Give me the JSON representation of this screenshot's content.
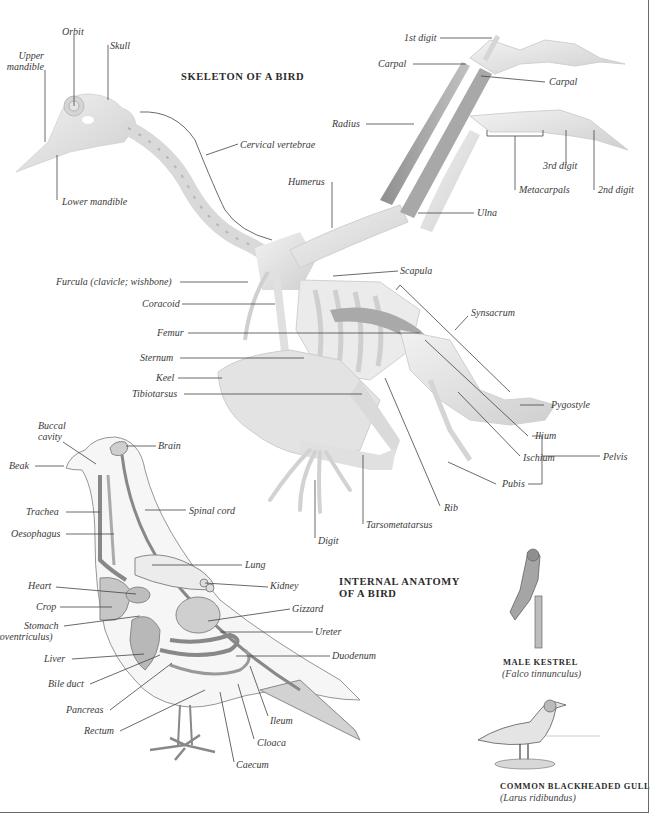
{
  "skeleton": {
    "title": "SKELETON OF A BIRD",
    "labels": {
      "orbit": "Orbit",
      "skull": "Skull",
      "upper_mandible_1": "Upper",
      "upper_mandible_2": "mandible",
      "lower_mandible": "Lower mandible",
      "cervical_vertebrae": "Cervical vertebrae",
      "first_digit": "1st digit",
      "carpal_left": "Carpal",
      "carpal_right": "Carpal",
      "radius": "Radius",
      "third_digit": "3rd digit",
      "metacarpals": "Metacarpals",
      "second_digit": "2nd digit",
      "humerus": "Humerus",
      "ulna": "Ulna",
      "furcula": "Furcula (clavicle; wishbone)",
      "scapula": "Scapula",
      "coracoid": "Coracoid",
      "synsacrum": "Synsacrum",
      "femur": "Femur",
      "sternum": "Sternum",
      "keel": "Keel",
      "tibiotarsus": "Tibiotarsus",
      "pygostyle": "Pygostyle",
      "ilium": "Ilium",
      "ischium": "Ischium",
      "pelvis": "Pelvis",
      "pubis": "Pubis",
      "rib": "Rib",
      "tarsometatarsus": "Tarsometatarsus",
      "digit": "Digit"
    }
  },
  "internal": {
    "title_line1": "INTERNAL ANATOMY",
    "title_line2": "OF A BIRD",
    "labels": {
      "buccal_1": "Buccal",
      "buccal_2": "cavity",
      "brain": "Brain",
      "beak": "Beak",
      "trachea": "Trachea",
      "spinal_cord": "Spinal cord",
      "oesophagus": "Oesophagus",
      "lung": "Lung",
      "heart": "Heart",
      "kidney": "Kidney",
      "crop": "Crop",
      "gizzard": "Gizzard",
      "stomach_1": "Stomach",
      "stomach_2": "(proventriculus)",
      "ureter": "Ureter",
      "liver": "Liver",
      "duodenum": "Duodenum",
      "bile_duct": "Bile duct",
      "pancreas": "Pancreas",
      "ileum": "Ileum",
      "rectum": "Rectum",
      "cloaca": "Cloaca",
      "caecum": "Caecum"
    }
  },
  "species": [
    {
      "common": "MALE KESTREL",
      "scientific": "(Falco tinnunculus)"
    },
    {
      "common": "COMMON BLACKHEADED GULL",
      "scientific": "(Larus ridibundus)"
    }
  ],
  "colors": {
    "bone": "#e6e6e6",
    "bone_shadow": "#b9b9b9",
    "organ": "#c9c9c9",
    "leader_line": "#444444",
    "frame": "#6a6a6a"
  }
}
